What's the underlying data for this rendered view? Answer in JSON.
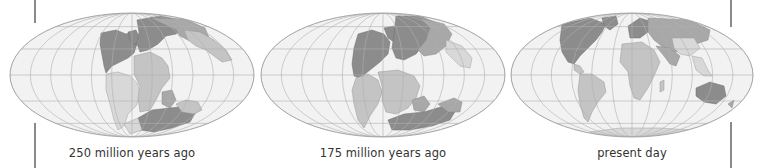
{
  "figure": {
    "panels": [
      {
        "id": "panel-250",
        "caption": "250 million years ago",
        "supercontinent": "Pangaea"
      },
      {
        "id": "panel-175",
        "caption": "175 million years ago",
        "supercontinent": "Laurasia and Gondwana"
      },
      {
        "id": "panel-present",
        "caption": "present day",
        "supercontinent": "modern continents"
      }
    ]
  },
  "colors": {
    "ocean": "#f2f2f2",
    "graticule": "#b5b5b5",
    "outline": "#9a9a9a",
    "land_dark": "#8c8c8c",
    "land_mid": "#a8a8a8",
    "land_light": "#c6c6c6",
    "land_pale": "#d9d9d9",
    "rule": "#8a8a8a",
    "caption_text": "#333333"
  }
}
